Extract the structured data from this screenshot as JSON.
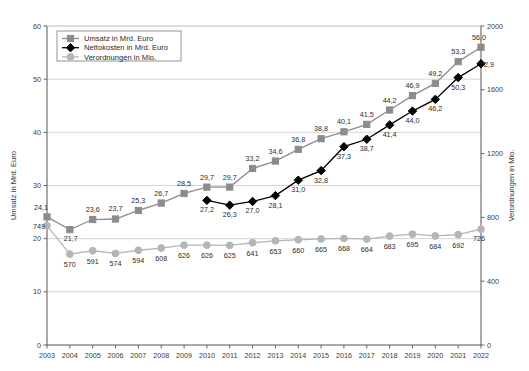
{
  "chart_data": {
    "type": "line",
    "title": "",
    "xlabel": "",
    "ylabel": "Umsatz in Mrd. Euro",
    "y2label": "Verordnungen in Mio.",
    "ylim": [
      0,
      60
    ],
    "y2lim": [
      0,
      2000
    ],
    "yticks": [
      "0",
      "10",
      "20",
      "30",
      "40",
      "50",
      "60"
    ],
    "y2ticks": [
      "0",
      "400",
      "800",
      "1200",
      "1600",
      "2000"
    ],
    "grid": true,
    "legend_position": "top-left",
    "categories": [
      "2003",
      "2004",
      "2005",
      "2006",
      "2007",
      "2008",
      "2009",
      "2010",
      "2011",
      "2012",
      "2013",
      "2014",
      "2015",
      "2016",
      "2017",
      "2018",
      "2019",
      "2020",
      "2021",
      "2022"
    ],
    "series": [
      {
        "name": "Umsatz in Mrd. Euro",
        "axis": "left",
        "color": "#8c8c8c",
        "marker": "square",
        "values": [
          24.1,
          21.7,
          23.6,
          23.7,
          25.3,
          26.7,
          28.5,
          29.7,
          29.7,
          33.2,
          34.6,
          36.8,
          38.8,
          40.1,
          41.5,
          44.2,
          46.9,
          49.2,
          53.3,
          56.0
        ],
        "labels": [
          "24,1",
          "21,7",
          "23,6",
          "23,7",
          "25,3",
          "26,7",
          "28,5",
          "29,7",
          "29,7",
          "33,2",
          "34,6",
          "36,8",
          "38,8",
          "40,1",
          "41,5",
          "44,2",
          "46,9",
          "49,2",
          "53,3",
          "56,0"
        ]
      },
      {
        "name": "Nettokosten in Mrd. Euro",
        "axis": "left",
        "color": "#000000",
        "marker": "diamond",
        "values": [
          null,
          null,
          null,
          null,
          null,
          null,
          null,
          27.2,
          26.3,
          27.0,
          28.1,
          31.0,
          32.8,
          37.3,
          38.7,
          41.4,
          44.0,
          46.2,
          50.3,
          52.9
        ],
        "labels": [
          "",
          "",
          "",
          "",
          "",
          "",
          "",
          "27,2",
          "26,3",
          "27,0",
          "28,1",
          "31,0",
          "32,8",
          "37,3",
          "38,7",
          "41,4",
          "44,0",
          "46,2",
          "50,3",
          "52,9"
        ]
      },
      {
        "name": "Verordnungen in Mio.",
        "axis": "right",
        "color": "#b5b5b5",
        "marker": "circle",
        "values": [
          749,
          570,
          591,
          574,
          594,
          608,
          626,
          626,
          625,
          641,
          653,
          660,
          665,
          668,
          664,
          683,
          695,
          684,
          692,
          726
        ],
        "labels": [
          "749",
          "570",
          "591",
          "574",
          "594",
          "608",
          "626",
          "626",
          "625",
          "641",
          "653",
          "660",
          "665",
          "668",
          "664",
          "683",
          "695",
          "684",
          "692",
          "726"
        ]
      }
    ]
  },
  "legend": {
    "items": [
      {
        "label": "Umsatz in Mrd. Euro"
      },
      {
        "label": "Nettokosten in Mrd. Euro"
      },
      {
        "label": "Verordnungen in Mio."
      }
    ]
  }
}
